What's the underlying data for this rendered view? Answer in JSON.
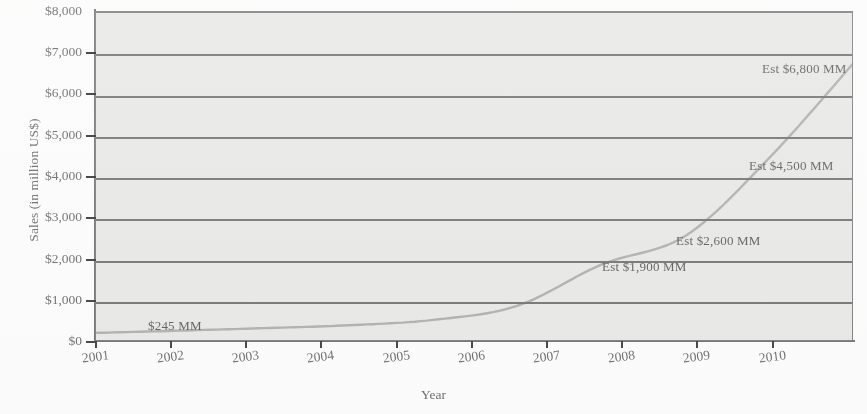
{
  "chart_data": {
    "type": "line",
    "title": "",
    "xlabel": "Year",
    "ylabel": "Sales (in million US$)",
    "x": [
      2001,
      2002,
      2003,
      2004,
      2005,
      2006,
      2007,
      2008,
      2009,
      2010
    ],
    "categories": [
      "2001",
      "2002",
      "2003",
      "2004",
      "2005",
      "2006",
      "2007",
      "2008",
      "2009",
      "2010"
    ],
    "values": [
      245,
      300,
      360,
      430,
      560,
      900,
      1900,
      2600,
      4500,
      6800
    ],
    "series": [
      {
        "name": "Sales",
        "values": [
          245,
          300,
          360,
          430,
          560,
          900,
          1900,
          2600,
          4500,
          6800
        ]
      }
    ],
    "ylim": [
      0,
      8000
    ],
    "ytick_values": [
      0,
      1000,
      2000,
      3000,
      4000,
      5000,
      6000,
      7000,
      8000
    ],
    "ytick_labels": [
      "$0",
      "$1,000",
      "$2,000",
      "$3,000",
      "$4,000",
      "$5,000",
      "$6,000",
      "$7,000",
      "$8,000"
    ],
    "xlim": [
      2001,
      2010
    ],
    "grid": "horizontal",
    "legend": "none",
    "line_color": "#9a9a9a",
    "plot_background": "#e3e3e1",
    "axis_color": "#4a4a4a",
    "annotations": [
      {
        "text": "$245 MM",
        "x_year": 2001.6,
        "value": 245
      },
      {
        "text": "Est $1,900 MM",
        "x_year": 2007.0,
        "value": 1900
      },
      {
        "text": "Est $2,600 MM",
        "x_year": 2008.0,
        "value": 2600
      },
      {
        "text": "Est $4,500 MM",
        "x_year": 2009.0,
        "value": 4500
      },
      {
        "text": "Est $6,800 MM",
        "x_year": 2010.0,
        "value": 6800
      }
    ]
  },
  "axis": {
    "y_title": "Sales (in million US$)",
    "x_title": "Year",
    "y_labels": [
      {
        "text": "$8,000",
        "top": 11
      },
      {
        "text": "$7,000",
        "top": 52
      },
      {
        "text": "$6,000",
        "top": 93
      },
      {
        "text": "$5,000",
        "top": 135
      },
      {
        "text": "$4,000",
        "top": 176
      },
      {
        "text": "$3,000",
        "top": 217
      },
      {
        "text": "$2,000",
        "top": 259
      },
      {
        "text": "$1,000",
        "top": 300
      },
      {
        "text": "$0",
        "top": 341
      }
    ],
    "x_labels": [
      {
        "text": "2001",
        "left": 95
      },
      {
        "text": "2002",
        "left": 170
      },
      {
        "text": "2003",
        "left": 245
      },
      {
        "text": "2004",
        "left": 320
      },
      {
        "text": "2005",
        "left": 396
      },
      {
        "text": "2006",
        "left": 471
      },
      {
        "text": "2007",
        "left": 546
      },
      {
        "text": "2008",
        "left": 621
      },
      {
        "text": "2009",
        "left": 696
      },
      {
        "text": "2010",
        "left": 772
      }
    ]
  },
  "annotations_positioned": [
    {
      "text": "$245 MM",
      "left": 148,
      "top": 318
    },
    {
      "text": "Est $1,900 MM",
      "left": 602,
      "top": 259
    },
    {
      "text": "Est $2,600 MM",
      "left": 676,
      "top": 233
    },
    {
      "text": "Est $4,500 MM",
      "left": 749,
      "top": 158
    },
    {
      "text": "Est $6,800 MM",
      "left": 762,
      "top": 61
    }
  ]
}
